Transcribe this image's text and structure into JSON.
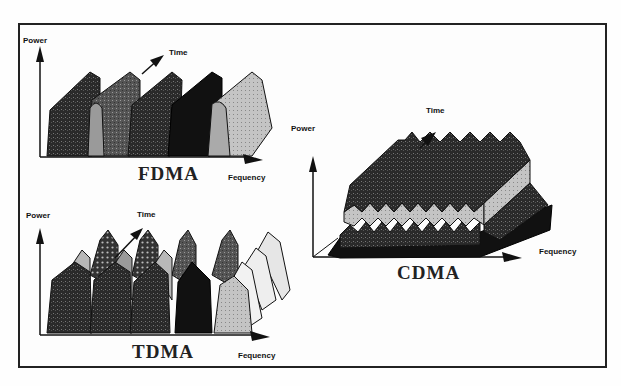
{
  "fdma": {
    "title": "FDMA",
    "y_axis_label": "Power",
    "time_axis_label": "Time",
    "x_axis_label": "Frequency",
    "x_axis_label_as_printed": "Fequency"
  },
  "tdma": {
    "title": "TDMA",
    "y_axis_label": "Power",
    "time_axis_label": "Time",
    "x_axis_label": "Frequency",
    "x_axis_label_as_printed": "Fequency"
  },
  "cdma": {
    "title": "CDMA",
    "y_axis_label": "Power",
    "time_axis_label": "Time",
    "x_axis_label": "Frequency",
    "x_axis_label_as_printed": "Fequency"
  },
  "colors": {
    "frame": "#222222",
    "ink": "#111111",
    "dark_fill": "#2a2a2a",
    "mid_fill": "#555555",
    "light_fill": "#bdbdbd",
    "pale_fill": "#dcdcdc"
  }
}
